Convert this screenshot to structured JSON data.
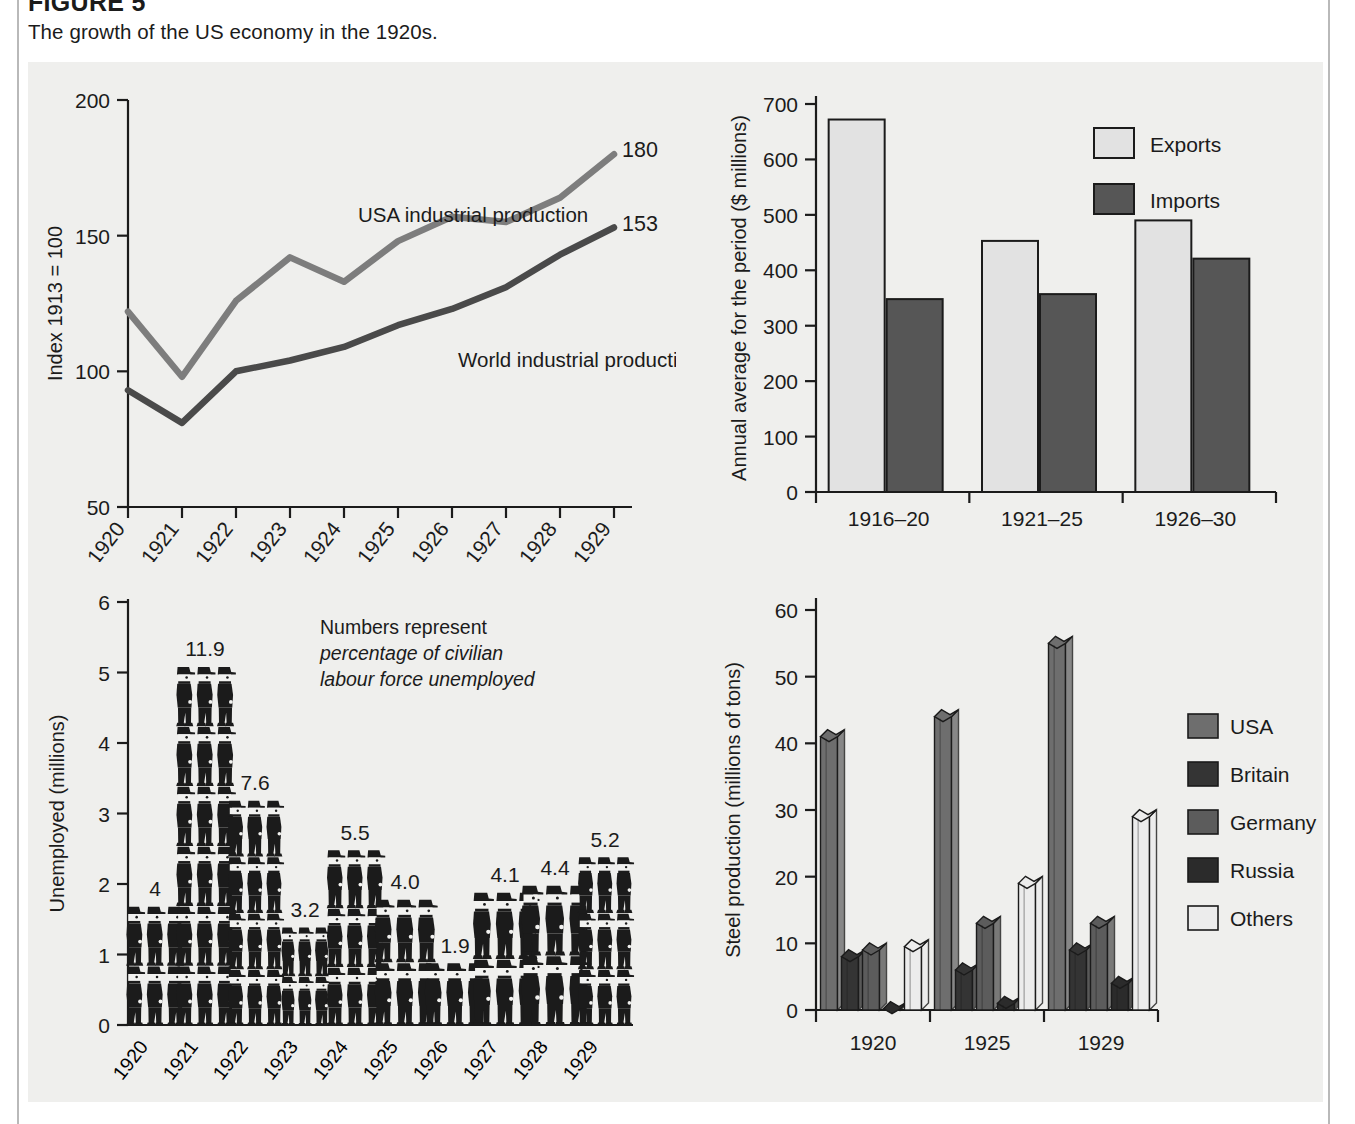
{
  "figure": {
    "number_label": "FIGURE 5",
    "caption": "The growth of the US economy in the 1920s."
  },
  "colors": {
    "panel_bg": "#efefed",
    "ink": "#1b1b1b",
    "usa_line": "#7d7d7d",
    "world_line": "#4a4a4a",
    "exports_fill": "#e2e2e2",
    "imports_fill": "#565656",
    "steel_usa": "#6e6e6e",
    "steel_britain": "#343434",
    "steel_germany": "#5c5c5c",
    "steel_russia": "#2b2b2b",
    "steel_others": "#ececec"
  },
  "chart_data": [
    {
      "id": "industrial-production",
      "type": "line",
      "title": "",
      "xlabel": "",
      "ylabel": "Index 1913 = 100",
      "x": [
        "1920",
        "1921",
        "1922",
        "1923",
        "1924",
        "1925",
        "1926",
        "1927",
        "1928",
        "1929"
      ],
      "ylim": [
        50,
        200
      ],
      "yticks": [
        50,
        100,
        150,
        200
      ],
      "grid": false,
      "series": [
        {
          "name": "USA industrial production",
          "values": [
            122,
            98,
            126,
            142,
            133,
            148,
            157,
            155,
            164,
            180
          ],
          "end_label": "180"
        },
        {
          "name": "World industrial production",
          "values": [
            93,
            81,
            100,
            104,
            109,
            117,
            123,
            131,
            143,
            153
          ],
          "end_label": "153"
        }
      ]
    },
    {
      "id": "trade",
      "type": "bar",
      "title": "",
      "xlabel": "",
      "ylabel": "Annual average for the period ($ millions)",
      "categories": [
        "1916–20",
        "1921–25",
        "1926–30"
      ],
      "ylim": [
        0,
        700
      ],
      "yticks": [
        0,
        100,
        200,
        300,
        400,
        500,
        600,
        700
      ],
      "grid": false,
      "legend_position": "top-right",
      "series": [
        {
          "name": "Exports",
          "values": [
            672,
            453,
            490
          ]
        },
        {
          "name": "Imports",
          "values": [
            348,
            357,
            421
          ]
        }
      ]
    },
    {
      "id": "unemployment",
      "type": "bar",
      "title": "",
      "xlabel": "",
      "ylabel": "Unemployed (millions)",
      "annotation_lines": [
        "Numbers represent",
        "percentage of civilian",
        "labour force unemployed"
      ],
      "categories": [
        "1920",
        "1921",
        "1922",
        "1923",
        "1924",
        "1925",
        "1926",
        "1927",
        "1928",
        "1929"
      ],
      "values": [
        1.7,
        5.1,
        3.2,
        1.4,
        2.5,
        1.8,
        0.9,
        1.9,
        2.0,
        2.4
      ],
      "data_labels": [
        "4",
        "11.9",
        "7.6",
        "3.2",
        "5.5",
        "4.0",
        "1.9",
        "4.1",
        "4.4",
        "5.2"
      ],
      "ylim": [
        0,
        6
      ],
      "yticks": [
        0,
        1,
        2,
        3,
        4,
        5,
        6
      ],
      "grid": false,
      "pictogram": true
    },
    {
      "id": "steel",
      "type": "bar",
      "title": "",
      "xlabel": "",
      "ylabel": "Steel production (millions of tons)",
      "categories": [
        "1920",
        "1925",
        "1929"
      ],
      "ylim": [
        0,
        60
      ],
      "yticks": [
        0,
        10,
        20,
        30,
        40,
        50,
        60
      ],
      "grid": false,
      "legend_position": "right",
      "series": [
        {
          "name": "USA",
          "values": [
            41,
            44,
            55
          ]
        },
        {
          "name": "Britain",
          "values": [
            8,
            6,
            9
          ]
        },
        {
          "name": "Germany",
          "values": [
            9,
            13,
            13
          ]
        },
        {
          "name": "Russia",
          "values": [
            0.2,
            1,
            4
          ]
        },
        {
          "name": "Others",
          "values": [
            9.5,
            19,
            29
          ]
        }
      ]
    }
  ]
}
